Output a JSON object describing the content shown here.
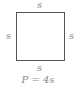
{
  "diagram": {
    "shape": "square",
    "labels": {
      "top": "s",
      "left": "s",
      "right": "s",
      "bottom": "s"
    },
    "formula": "P = 4s",
    "colors": {
      "outline": "#555555",
      "text": "#8a8a8a"
    }
  }
}
